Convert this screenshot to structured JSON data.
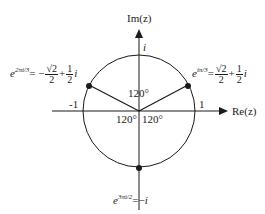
{
  "diagram": {
    "axes": {
      "x_label": "Re(z)",
      "y_label": "Im(z)",
      "x_ticks": [
        "-1",
        "1"
      ],
      "y_ticks": [
        "i"
      ]
    },
    "angles": [
      "120°",
      "120°",
      "120°"
    ],
    "points": [
      {
        "lhs_base": "e",
        "lhs_exp": "2πi/3",
        "eq": "=",
        "sign": "−",
        "num1": "√2",
        "den1": "2",
        "plus": "+",
        "num2": "1",
        "den2": "2",
        "unit": "i"
      },
      {
        "lhs_base": "e",
        "lhs_exp": "iπ/3",
        "eq": "=",
        "sign": "",
        "num1": "√2",
        "den1": "2",
        "plus": "+",
        "num2": "1",
        "den2": "2",
        "unit": "i"
      },
      {
        "lhs_base": "e",
        "lhs_exp": "3πi/2",
        "eq": "=−",
        "unit": "i"
      }
    ],
    "colors": {
      "ink": "#1a1a1a",
      "background": "#ffffff"
    }
  }
}
